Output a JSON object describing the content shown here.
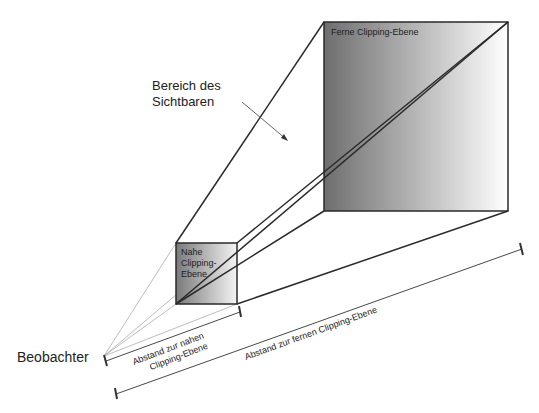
{
  "diagram": {
    "type": "view-frustum",
    "labels": {
      "far_plane": "Ferne Clipping-Ebene",
      "near_plane_line1": "Nahe",
      "near_plane_line2": "Clipping-",
      "near_plane_line3": "Ebene",
      "visible_region_line1": "Bereich des",
      "visible_region_line2": "Sichtbaren",
      "observer": "Beobachter",
      "near_distance_line1": "Abstand zur nahen",
      "near_distance_line2": "Clipping-Ebene",
      "far_distance": "Abstand zur fernen Clipping-Ebene"
    },
    "colors": {
      "stroke": "#2a2a2a",
      "thin_stroke": "#9a9a9a",
      "gradient_dark": "#6e6e6e",
      "gradient_light": "#ffffff"
    }
  }
}
